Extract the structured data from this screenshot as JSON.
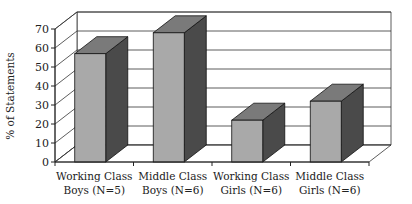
{
  "chart_data": {
    "type": "bar",
    "style": "3d-column",
    "title": "",
    "xlabel": "",
    "ylabel": "% of Statements",
    "ylim": [
      0,
      70
    ],
    "yticks": [
      0,
      10,
      20,
      30,
      40,
      50,
      60,
      70
    ],
    "grid": true,
    "legend": null,
    "categories": [
      [
        "Working Class",
        "Boys (N=5)"
      ],
      [
        "Middle Class",
        "Boys (N=6)"
      ],
      [
        "Working Class",
        "Girls (N=6)"
      ],
      [
        "Middle Class",
        "Girls (N=6)"
      ]
    ],
    "values": [
      57,
      68,
      22,
      32
    ]
  },
  "colors": {
    "bar_front": "#a9a9a9",
    "bar_top": "#7a7a7a",
    "bar_side": "#4a4a4a",
    "grid": "#333333",
    "wall": "#ffffff"
  }
}
